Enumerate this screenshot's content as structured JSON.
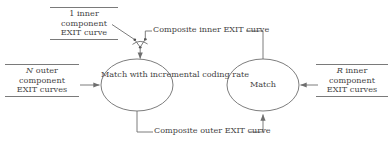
{
  "diagram": {
    "stroke_color": "#6e6e6e",
    "text_color": "#444444",
    "background": "#ffffff",
    "nodes": [
      {
        "id": "match-incremental",
        "lines": [
          "Match with",
          "incremental",
          "coding rate"
        ],
        "shape": "ellipse"
      },
      {
        "id": "match",
        "lines": [
          "Match"
        ],
        "shape": "ellipse"
      }
    ],
    "inputs": {
      "top_left": {
        "lines": [
          "1 inner",
          "component",
          "EXIT curve"
        ],
        "rules": true
      },
      "left": {
        "lines": [
          "N outer",
          "component",
          "EXIT curves"
        ],
        "italic_first_token": "N",
        "rules": true
      },
      "right": {
        "lines": [
          "R inner",
          "component",
          "EXIT curves"
        ],
        "italic_first_token": "R",
        "rules": true
      }
    },
    "edge_labels": {
      "composite_inner": [
        "Composite inner",
        "EXIT curve"
      ],
      "composite_outer": [
        "Composite outer",
        "EXIT curve"
      ]
    }
  }
}
